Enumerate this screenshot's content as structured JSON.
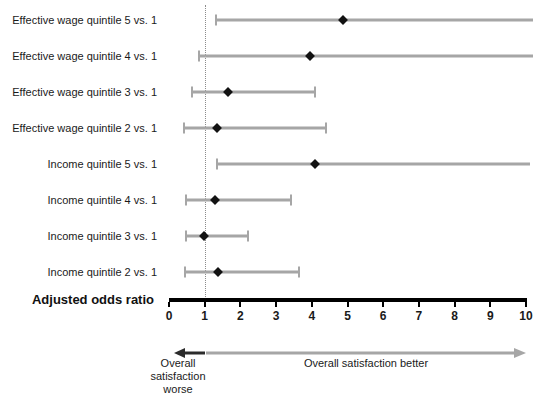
{
  "chart_data": {
    "type": "scatter",
    "plot_style": "forest-plot",
    "title": "",
    "xlabel": "Adjusted odds ratio",
    "ylabel": "",
    "xlim": [
      0,
      10
    ],
    "xticks": [
      0,
      1,
      2,
      3,
      4,
      5,
      6,
      7,
      8,
      9,
      10
    ],
    "xtick_labels": [
      "0",
      "1",
      "2",
      "3",
      "4",
      "5",
      "6",
      "7",
      "8",
      "9",
      "10"
    ],
    "grid": false,
    "legend": "none",
    "reference_line": {
      "value": 1,
      "style": "dotted",
      "color": "#8c8c8c"
    },
    "categories": [
      "Effective wage quintile 5 vs. 1",
      "Effective wage quintile 4 vs. 1",
      "Effective wage quintile 3 vs. 1",
      "Effective wage quintile 2 vs. 1",
      "Income quintile 5 vs. 1",
      "Income quintile 4 vs. 1",
      "Income quintile 3 vs. 1",
      "Income quintile 2 vs. 1"
    ],
    "rows": [
      {
        "label": "Effective wage quintile 5 vs. 1",
        "estimate": 4.87,
        "ci_low": 1.32,
        "ci_high": 10.2,
        "ci_high_clipped": true
      },
      {
        "label": "Effective wage quintile 4 vs. 1",
        "estimate": 3.95,
        "ci_low": 0.84,
        "ci_high": 10.2,
        "ci_high_clipped": true
      },
      {
        "label": "Effective wage quintile 3 vs. 1",
        "estimate": 1.65,
        "ci_low": 0.64,
        "ci_high": 4.09,
        "ci_high_clipped": false
      },
      {
        "label": "Effective wage quintile 2 vs. 1",
        "estimate": 1.34,
        "ci_low": 0.42,
        "ci_high": 4.4,
        "ci_high_clipped": false
      },
      {
        "label": "Income quintile 5 vs. 1",
        "estimate": 4.09,
        "ci_low": 1.35,
        "ci_high": 10.1,
        "ci_high_clipped": true
      },
      {
        "label": "Income quintile 4 vs. 1",
        "estimate": 1.29,
        "ci_low": 0.48,
        "ci_high": 3.42,
        "ci_high_clipped": false
      },
      {
        "label": "Income quintile 3 vs. 1",
        "estimate": 0.98,
        "ci_low": 0.48,
        "ci_high": 2.21,
        "ci_high_clipped": false
      },
      {
        "label": "Income quintile 2 vs. 1",
        "estimate": 1.37,
        "ci_low": 0.45,
        "ci_high": 3.64,
        "ci_high_clipped": false
      }
    ],
    "annotations": {
      "left_direction": "Overall satisfaction worse",
      "right_direction": "Overall satisfaction better"
    },
    "colors": {
      "ci_line": "#a6a6a6",
      "point": "#121212",
      "axis": "#000000",
      "reference": "#8c8c8c",
      "arrow_left": "#2b2b2b",
      "arrow_right": "#a6a6a6"
    }
  },
  "axis": {
    "title": "Adjusted odds ratio"
  },
  "footer": {
    "worse_label": "Overall satisfaction worse",
    "better_label": "Overall satisfaction better",
    "arrow_left_name": "arrow-left",
    "arrow_right_name": "arrow-right"
  }
}
